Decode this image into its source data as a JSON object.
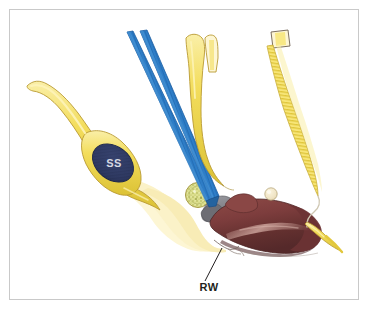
{
  "figure": {
    "kind": "anatomical-illustration",
    "width": 368,
    "height": 309,
    "background_color": "#ffffff",
    "frame": {
      "name": "image-border",
      "color": "#c9c9c9",
      "stroke_width": 1,
      "x": 9,
      "y": 9,
      "width": 350,
      "height": 291
    }
  },
  "labels": [
    {
      "id": "ss",
      "text": "SS",
      "color": "#d5d9e2",
      "font_size": 11,
      "x": 114,
      "y": 167,
      "anchor": "middle",
      "description": "sigmoid sinus"
    },
    {
      "id": "rw",
      "text": "RW",
      "color": "#231f20",
      "font_size": 11,
      "x": 209,
      "y": 291,
      "anchor": "middle",
      "description": "round window"
    }
  ],
  "leader_lines": [
    {
      "id": "rw-leader",
      "color": "#231f20",
      "stroke_width": 1,
      "from_x": 205,
      "from_y": 281,
      "to_x": 222,
      "to_y": 248
    }
  ],
  "palette": {
    "yellow_fill": "#f5e06a",
    "yellow_light": "#faf0b4",
    "yellow_pale": "#fdf6d4",
    "yellow_deep": "#e8cf3c",
    "yellow_outline": "#b99a32",
    "blue_instrument": "#2e7ec8",
    "blue_instrument_dark": "#1e5fa0",
    "navy_sinus": "#2f3a63",
    "navy_sinus_edge": "#1e2746",
    "cochlea_brown": "#7d3d3d",
    "cochlea_brown_dark": "#5b2b2c",
    "cochlea_highlight": "#c89a94",
    "bone_gray": "#7a7a80",
    "bone_gray_light": "#9a9aa0",
    "graft_speckle": "#cdd07a",
    "nodule_cream": "#efe3c3",
    "outline_gray": "#8a8a8a",
    "frame_gray": "#c9c9c9"
  },
  "structures": [
    {
      "id": "sigmoid-sinus-tube",
      "name": "sigmoid-sinus",
      "label_ref": "ss",
      "fill": "#f5e06a",
      "description": "yellow curved tube descending from upper-left with dark navy lumen ellipse"
    },
    {
      "id": "sinus-lumen",
      "name": "sigmoid-sinus-lumen",
      "fill": "#2f3a63",
      "description": "dark navy ellipse inside the yellow tube"
    },
    {
      "id": "bone-graft-disc",
      "name": "bone-graft-disc",
      "fill": "#cdd07a",
      "description": "small speckled greenish-yellow circular graft"
    },
    {
      "id": "mastoid-cavity",
      "name": "mastoid-cavity",
      "fill": "#fdf6d4",
      "description": "pale yellow soft-tissue field around the sinus"
    },
    {
      "id": "cochlea-promontory",
      "name": "cochlea-promontory",
      "fill": "#7d3d3d",
      "description": "dark reddish-brown cochlear promontory mass at lower right"
    },
    {
      "id": "bone-fragments",
      "name": "bone-fragments",
      "fill": "#7a7a80",
      "description": "gray bone / facial recess region"
    },
    {
      "id": "ossicle-nodule",
      "name": "ossicle-nodule",
      "fill": "#efe3c3",
      "description": "small cream nodule on top of the promontory"
    }
  ],
  "instruments": [
    {
      "id": "blue-dissector",
      "name": "blue-dissector-instrument",
      "color": "#2e7ec8",
      "description": "two parallel blue shafts angling from upper-left to the round window"
    },
    {
      "id": "yellow-forceps",
      "name": "yellow-forked-instrument",
      "color": "#f5e06a",
      "description": "yellow forked probe with split tip at the top, curving down"
    },
    {
      "id": "electrode-array",
      "name": "electrode-array",
      "color": "#f5e06a",
      "description": "banded yellow cochlear electrode array entering from upper right"
    }
  ]
}
